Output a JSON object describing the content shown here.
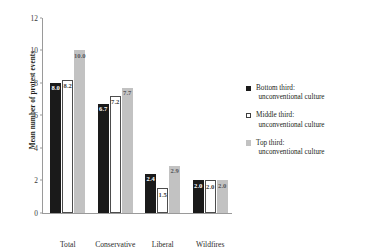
{
  "chart_data": {
    "type": "bar",
    "title": "",
    "xlabel": "",
    "ylabel": "Mean number of protest events",
    "categories": [
      "Total",
      "Conservative",
      "Liberal",
      "Wildfires"
    ],
    "ylim": [
      0,
      12
    ],
    "yticks": [
      "0",
      "2",
      "4",
      "6",
      "8",
      "10",
      "12"
    ],
    "grid": false,
    "legend_position": "right",
    "series": [
      {
        "name": "Bottom third: unconventional culture",
        "color": "#1a1a1a",
        "values": [
          8.0,
          6.7,
          2.4,
          2.0
        ],
        "labels": [
          "8.0",
          "6.7",
          "2.4",
          "2.0"
        ]
      },
      {
        "name": "Middle third: unconventional culture",
        "color": "#ffffff",
        "values": [
          8.2,
          7.2,
          1.5,
          2.0
        ],
        "labels": [
          "8.2",
          "7.2",
          "1.5",
          "2.0"
        ]
      },
      {
        "name": "Top third: unconventional culture",
        "color": "#c2c2c2",
        "values": [
          10.0,
          7.7,
          2.9,
          2.0
        ],
        "labels": [
          "10.0",
          "7.7",
          "2.9",
          "2.0"
        ]
      }
    ]
  },
  "legend": {
    "items": [
      {
        "line1": "Bottom third:",
        "line2": "unconventional culture"
      },
      {
        "line1": "Middle third:",
        "line2": "unconventional culture"
      },
      {
        "line1": "Top third:",
        "line2": "unconventional culture"
      }
    ]
  },
  "axes": {
    "y_title": "Mean number of protest events"
  }
}
